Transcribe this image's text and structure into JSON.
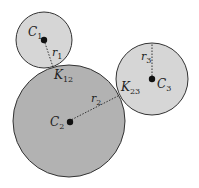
{
  "diagram": {
    "type": "tangent-circles",
    "colors": {
      "background": "#ffffff",
      "small_circle_fill": "#d6d6d6",
      "large_circle_fill": "#b2b2b2",
      "stroke": "#333333",
      "center_dot": "#111111",
      "radius_line": "#333333"
    },
    "circles": [
      {
        "id": "C1",
        "label": "C",
        "label_sub": "1",
        "radius_label": "r",
        "radius_sub": "1",
        "cx": 44,
        "cy": 40,
        "r": 28
      },
      {
        "id": "C2",
        "label": "C",
        "label_sub": "2",
        "radius_label": "r",
        "radius_sub": "2",
        "cx": 69,
        "cy": 121,
        "r": 56
      },
      {
        "id": "C3",
        "label": "C",
        "label_sub": "3",
        "radius_label": "r",
        "radius_sub": "3",
        "cx": 152,
        "cy": 79,
        "r": 36
      }
    ],
    "tangent_points": [
      {
        "id": "K12",
        "label": "K",
        "label_sub": "12",
        "x": 53,
        "y": 67
      },
      {
        "id": "K23",
        "label": "K",
        "label_sub": "23",
        "x": 118,
        "y": 96
      }
    ]
  }
}
